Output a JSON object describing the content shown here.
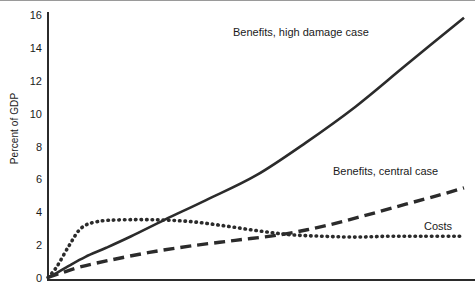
{
  "chart_data": {
    "type": "line",
    "title": "",
    "subtitle": "",
    "xlabel": "",
    "ylabel": "Percent of GDP",
    "ylim": [
      0,
      16
    ],
    "xlim": [
      0,
      100
    ],
    "yticks": [
      0,
      2,
      4,
      6,
      8,
      10,
      12,
      14,
      16
    ],
    "ytick_labels": [
      "0",
      "2",
      "4",
      "6",
      "8",
      "10",
      "12",
      "14",
      "16"
    ],
    "xticks": [],
    "xtick_labels": [],
    "grid": false,
    "legend_position": "inline-annotations",
    "series": [
      {
        "name": "Benefits, high damage case",
        "style": "solid",
        "color": "#2b2b2b",
        "x": [
          0,
          2,
          5,
          9,
          14,
          20,
          28,
          38,
          50,
          62,
          74,
          86,
          100
        ],
        "values": [
          0.1,
          0.35,
          0.8,
          1.35,
          1.9,
          2.6,
          3.6,
          4.8,
          6.3,
          8.3,
          10.5,
          13.0,
          15.9
        ]
      },
      {
        "name": "Benefits, central case",
        "style": "dashed",
        "color": "#2b2b2b",
        "x": [
          0,
          3,
          8,
          15,
          24,
          34,
          45,
          56,
          66,
          76,
          86,
          94,
          100
        ],
        "values": [
          0.1,
          0.35,
          0.75,
          1.15,
          1.6,
          2.0,
          2.35,
          2.7,
          3.2,
          3.85,
          4.55,
          5.1,
          5.55
        ]
      },
      {
        "name": "Costs",
        "style": "dotted",
        "color": "#2b2b2b",
        "x": [
          0,
          2,
          5,
          8,
          12,
          18,
          26,
          34,
          42,
          50,
          58,
          66,
          74,
          82,
          90,
          100
        ],
        "values": [
          0.1,
          0.7,
          2.0,
          3.1,
          3.5,
          3.6,
          3.6,
          3.5,
          3.25,
          2.95,
          2.7,
          2.6,
          2.55,
          2.6,
          2.6,
          2.6
        ]
      }
    ],
    "annotations": [
      {
        "text": "Benefits, high damage case",
        "series": "Benefits, high damage case"
      },
      {
        "text": "Benefits, central case",
        "series": "Benefits, central case"
      },
      {
        "text": "Costs",
        "series": "Costs"
      }
    ]
  }
}
